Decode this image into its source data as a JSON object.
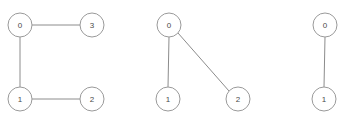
{
  "canvas": {
    "width": 348,
    "height": 126,
    "background_color": "#ffffff"
  },
  "style": {
    "node_radius": 12,
    "node_fill": "#ffffff",
    "node_stroke": "#9a9a9a",
    "node_stroke_width": 1,
    "edge_stroke": "#8c8c8c",
    "edge_stroke_width": 1,
    "label_color": "#4a4a4a",
    "label_font_size": 8
  },
  "graphs": [
    {
      "id": "graph-1",
      "node_count": 4,
      "edge_count": 3,
      "nodes": [
        {
          "label": "0",
          "x": 20,
          "y": 25
        },
        {
          "label": "3",
          "x": 92,
          "y": 25
        },
        {
          "label": "1",
          "x": 20,
          "y": 99
        },
        {
          "label": "2",
          "x": 92,
          "y": 99
        }
      ],
      "edges": [
        {
          "source": "0",
          "target": "3",
          "x1": 32,
          "y1": 25,
          "x2": 80,
          "y2": 25
        },
        {
          "source": "0",
          "target": "1",
          "x1": 20,
          "y1": 37,
          "x2": 20,
          "y2": 87
        },
        {
          "source": "1",
          "target": "2",
          "x1": 32,
          "y1": 99,
          "x2": 80,
          "y2": 99
        }
      ]
    },
    {
      "id": "graph-2",
      "node_count": 3,
      "edge_count": 2,
      "nodes": [
        {
          "label": "0",
          "x": 169,
          "y": 25
        },
        {
          "label": "1",
          "x": 168,
          "y": 99
        },
        {
          "label": "2",
          "x": 238,
          "y": 99
        }
      ],
      "edges": [
        {
          "source": "0",
          "target": "1",
          "x1": 169,
          "y1": 37,
          "x2": 168,
          "y2": 87
        },
        {
          "source": "0",
          "target": "2",
          "x1": 178,
          "y1": 33,
          "x2": 229,
          "y2": 91
        }
      ]
    },
    {
      "id": "graph-3",
      "node_count": 2,
      "edge_count": 1,
      "nodes": [
        {
          "label": "0",
          "x": 325,
          "y": 25
        },
        {
          "label": "1",
          "x": 324,
          "y": 99
        }
      ],
      "edges": [
        {
          "source": "0",
          "target": "1",
          "x1": 325,
          "y1": 37,
          "x2": 324,
          "y2": 87
        }
      ]
    }
  ]
}
